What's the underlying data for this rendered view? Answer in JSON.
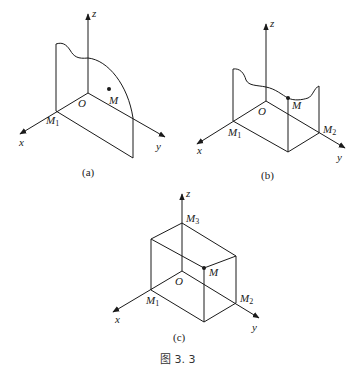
{
  "figure_caption": "图 3. 3",
  "axis_labels": {
    "x": "x",
    "y": "y",
    "z": "z",
    "origin": "O"
  },
  "panels": [
    {
      "id": "a",
      "caption": "(a)",
      "points": {
        "M": "M",
        "M1": "M",
        "M1_sub": "1"
      }
    },
    {
      "id": "b",
      "caption": "(b)",
      "points": {
        "M": "M",
        "M1": "M",
        "M1_sub": "1",
        "M2": "M",
        "M2_sub": "2"
      }
    },
    {
      "id": "c",
      "caption": "(c)",
      "points": {
        "M": "M",
        "M1": "M",
        "M1_sub": "1",
        "M2": "M",
        "M2_sub": "2",
        "M3": "M",
        "M3_sub": "3"
      }
    }
  ]
}
